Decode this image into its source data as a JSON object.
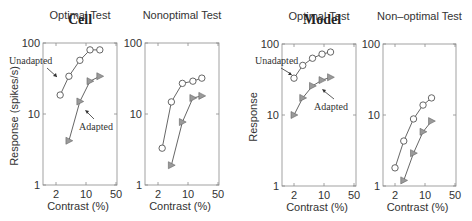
{
  "groups": [
    {
      "title": "Cell",
      "ylabel": "Response (spikes/s)"
    },
    {
      "title": "Model",
      "ylabel": "Response"
    }
  ],
  "chart_data": [
    {
      "type": "line",
      "group": "Cell",
      "title": "Optimal Test",
      "xlabel": "Contrast (%)",
      "ylabel": "Response (spikes/s)",
      "xscale": "log",
      "yscale": "log",
      "xlim": [
        1.5,
        50
      ],
      "ylim": [
        1,
        100
      ],
      "xticks": [
        "2",
        "10",
        "50"
      ],
      "yticks": [
        "1",
        "10",
        "100"
      ],
      "series": [
        {
          "name": "Unadapted",
          "marker": "circle",
          "x": [
            2.5,
            4.0,
            7.2,
            12.4,
            21
          ],
          "y": [
            18.5,
            34,
            57,
            80,
            80
          ]
        },
        {
          "name": "Adapted",
          "marker": "triangle-right",
          "x": [
            4.0,
            7.2,
            12.4,
            21
          ],
          "y": [
            4.2,
            15,
            29,
            34
          ]
        }
      ],
      "annotations": [
        {
          "text": "Unadapted",
          "target": "Unadapted"
        },
        {
          "text": "Adapted",
          "target": "Adapted"
        }
      ]
    },
    {
      "type": "line",
      "group": "Cell",
      "title": "Nonoptimal Test",
      "xlabel": "Contrast (%)",
      "ylabel": "",
      "xscale": "log",
      "yscale": "log",
      "xlim": [
        1.5,
        50
      ],
      "ylim": [
        1,
        100
      ],
      "xticks": [
        "2",
        "10",
        "50"
      ],
      "yticks": [
        "1",
        "10",
        "100"
      ],
      "series": [
        {
          "name": "Unadapted",
          "marker": "circle",
          "x": [
            2.5,
            4.1,
            7.4,
            13,
            21
          ],
          "y": [
            3.3,
            14.8,
            27,
            29,
            32
          ]
        },
        {
          "name": "Adapted",
          "marker": "triangle-right",
          "x": [
            4.1,
            7.4,
            13,
            21
          ],
          "y": [
            1.9,
            7.7,
            16.8,
            18
          ]
        }
      ]
    },
    {
      "type": "line",
      "group": "Model",
      "title": "Optimal Test",
      "xlabel": "Contrast (%)",
      "ylabel": "Response",
      "xscale": "log",
      "yscale": "log",
      "xlim": [
        1.5,
        50
      ],
      "ylim": [
        1,
        100
      ],
      "xticks": [
        "2",
        "10",
        "50"
      ],
      "yticks": [
        "1",
        "10",
        "100"
      ],
      "series": [
        {
          "name": "Unadapted",
          "marker": "circle",
          "x": [
            2.0,
            3.2,
            5.4,
            9.0,
            14.2
          ],
          "y": [
            33,
            50,
            63,
            72,
            77
          ]
        },
        {
          "name": "Adapted",
          "marker": "triangle-right",
          "x": [
            2.0,
            3.2,
            5.4,
            9.0,
            14.2
          ],
          "y": [
            10,
            17.4,
            25.7,
            31,
            34
          ]
        }
      ],
      "annotations": [
        {
          "text": "Unadapted",
          "target": "Unadapted"
        },
        {
          "text": "Adapted",
          "target": "Adapted"
        }
      ]
    },
    {
      "type": "line",
      "group": "Model",
      "title": "Non–optimal Test",
      "xlabel": "Contrast (%)",
      "ylabel": "",
      "xscale": "log",
      "yscale": "log",
      "xlim": [
        1.5,
        50
      ],
      "ylim": [
        1,
        100
      ],
      "xticks": [
        "2",
        "10",
        "50"
      ],
      "yticks": [
        "1",
        "10",
        "100"
      ],
      "series": [
        {
          "name": "Unadapted",
          "marker": "circle",
          "x": [
            2.0,
            3.2,
            5.4,
            9.0,
            14.2
          ],
          "y": [
            1.8,
            4.3,
            8.8,
            13.8,
            17.4
          ]
        },
        {
          "name": "Adapted",
          "marker": "triangle-right",
          "x": [
            3.2,
            5.4,
            9.0,
            14.2
          ],
          "y": [
            1.2,
            2.9,
            5.8,
            8.2
          ]
        }
      ]
    }
  ],
  "layout": {
    "panels": [
      {
        "left": 43,
        "top": 43,
        "right": 117,
        "bottom": 185,
        "x2px": 56,
        "x10px": 86
      },
      {
        "left": 145,
        "top": 43,
        "right": 219,
        "bottom": 185,
        "x2px": 158,
        "x10px": 188
      },
      {
        "left": 282,
        "top": 44,
        "right": 356,
        "bottom": 186,
        "x2px": 294,
        "x10px": 324
      },
      {
        "left": 383,
        "top": 44,
        "right": 456,
        "bottom": 186,
        "x2px": 395,
        "x10px": 425
      }
    ],
    "colors": {
      "axis": "#8a8a8a",
      "line": "#555555",
      "circle_fill": "#ffffff",
      "triangle_fill": "#9a9a9a",
      "text": "#333333"
    }
  }
}
